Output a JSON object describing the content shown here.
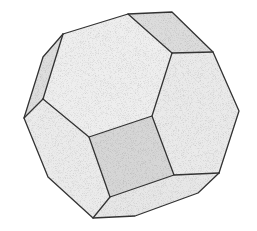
{
  "figure": {
    "colors": {
      "background": "#ffffff",
      "face_light": "#ebebeb",
      "face_mid": "#e0e0e0",
      "face_dark": "#d4d4d4",
      "edge": "#333333",
      "hidden_edge": "#bdbdbd"
    }
  }
}
